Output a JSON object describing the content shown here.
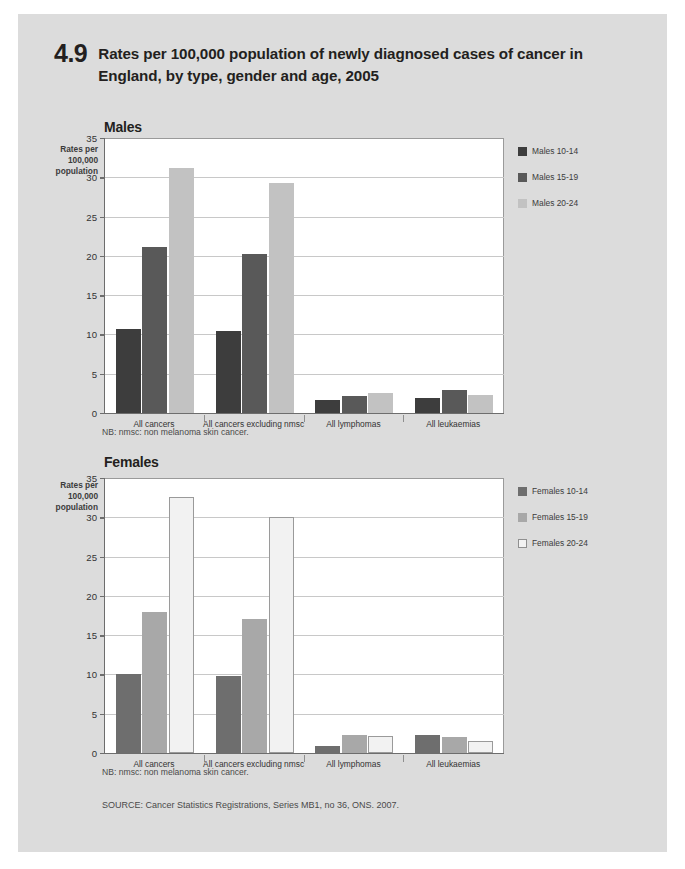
{
  "figure": {
    "number": "4.9",
    "title": "Rates per 100,000 population of newly diagnosed cases of cancer in England, by type, gender and age, 2005",
    "note": "NB: nmsc: non melanoma skin cancer.",
    "source": "SOURCE: Cancer Statistics Registrations, Series MB1, no 36, ONS. 2007."
  },
  "axis_caption": "Rates per 100,000 population",
  "colors": {
    "page_background": "#dcdcdc",
    "plot_background": "#ffffff",
    "axis": "#6d6d6d",
    "gridline": "#c8c8c8",
    "males_10_14": "#3d3d3d",
    "males_15_19": "#595959",
    "males_20_24": "#c2c2c2",
    "females_10_14": "#6e6e6e",
    "females_15_19": "#a8a8a8",
    "females_20_24": "#f2f2f2"
  },
  "chart_data": [
    {
      "type": "bar",
      "title": "Males",
      "xlabel": "",
      "ylabel": "Rates per 100,000 population",
      "ylim": [
        0,
        35
      ],
      "yticks": [
        0,
        5,
        10,
        15,
        20,
        25,
        30,
        35
      ],
      "grid": true,
      "legend_position": "right",
      "categories": [
        "All cancers",
        "All cancers excluding nmsc",
        "All lymphomas",
        "All leukaemias"
      ],
      "series": [
        {
          "name": "Males 10-14",
          "color": "#3d3d3d",
          "values": [
            10.7,
            10.4,
            1.6,
            1.9
          ]
        },
        {
          "name": "Males 15-19",
          "color": "#595959",
          "values": [
            21.1,
            20.3,
            2.2,
            2.9
          ]
        },
        {
          "name": "Males 20-24",
          "color": "#c2c2c2",
          "values": [
            31.2,
            29.3,
            2.5,
            2.3
          ]
        }
      ]
    },
    {
      "type": "bar",
      "title": "Females",
      "xlabel": "",
      "ylabel": "Rates per 100,000 population",
      "ylim": [
        0,
        35
      ],
      "yticks": [
        0,
        5,
        10,
        15,
        20,
        25,
        30,
        35
      ],
      "grid": true,
      "legend_position": "right",
      "categories": [
        "All cancers",
        "All cancers excluding nmsc",
        "All lymphomas",
        "All leukaemias"
      ],
      "series": [
        {
          "name": "Females 10-14",
          "color": "#6e6e6e",
          "values": [
            10.1,
            9.8,
            0.9,
            2.3
          ]
        },
        {
          "name": "Females 15-19",
          "color": "#a8a8a8",
          "values": [
            17.9,
            17.1,
            2.3,
            2.1
          ]
        },
        {
          "name": "Females 20-24",
          "color": "#f2f2f2",
          "values": [
            32.6,
            30.1,
            2.2,
            1.5
          ]
        }
      ]
    }
  ]
}
